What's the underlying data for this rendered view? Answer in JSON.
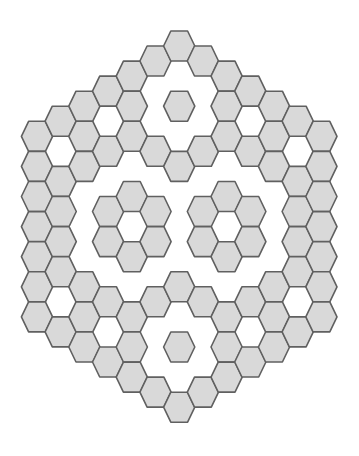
{
  "figure": {
    "orientation": "flat-top",
    "colors": {
      "background": "#ffffff",
      "hex_fill": "#d9d9d9",
      "hex_stroke": "#606060"
    },
    "geometry": {
      "x0": 37,
      "col_step": 23.7,
      "even_y0": 46,
      "odd_y0": 61,
      "row_step": 30.1,
      "half_width": 15.6,
      "half_top_edge": 8.4,
      "half_height": 15.0
    },
    "columns": [
      {
        "col": 0,
        "filled_y_indices": [
          3,
          4,
          5,
          6,
          7,
          8,
          9
        ]
      },
      {
        "col": 1,
        "filled_y_indices": [
          2,
          4,
          5,
          6,
          7,
          9
        ]
      },
      {
        "col": 2,
        "filled_y_indices": [
          2,
          3,
          4,
          8,
          9,
          10
        ]
      },
      {
        "col": 3,
        "filled_y_indices": [
          1,
          3,
          5,
          6,
          8,
          10
        ]
      },
      {
        "col": 4,
        "filled_y_indices": [
          1,
          2,
          3,
          5,
          7,
          9,
          10,
          11
        ]
      },
      {
        "col": 5,
        "filled_y_indices": [
          0,
          3,
          5,
          6,
          8,
          11
        ]
      },
      {
        "col": 6,
        "filled_y_indices": [
          0,
          2,
          4,
          8,
          10,
          12
        ]
      },
      {
        "col": 7,
        "filled_y_indices": [
          0,
          3,
          5,
          6,
          8,
          11
        ]
      },
      {
        "col": 8,
        "filled_y_indices": [
          1,
          2,
          3,
          5,
          7,
          9,
          10,
          11
        ]
      },
      {
        "col": 9,
        "filled_y_indices": [
          1,
          3,
          5,
          6,
          8,
          10
        ]
      },
      {
        "col": 10,
        "filled_y_indices": [
          2,
          3,
          4,
          8,
          9,
          10
        ]
      },
      {
        "col": 11,
        "filled_y_indices": [
          2,
          4,
          5,
          6,
          7,
          9
        ]
      },
      {
        "col": 12,
        "filled_y_indices": [
          3,
          4,
          5,
          6,
          7,
          8,
          9
        ]
      }
    ]
  }
}
